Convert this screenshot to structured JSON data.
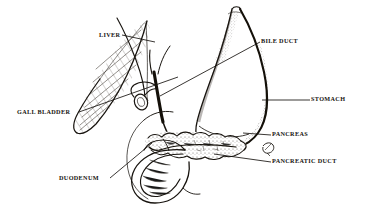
{
  "figure": {
    "kind": "anatomical-line-drawing",
    "background_color": "#ffffff",
    "ink_color": "#16130f",
    "width": 367,
    "height": 219
  },
  "labels": {
    "liver": "LIVER",
    "bile_duct": "BILE DUCT",
    "gall_bladder": "GALL BLADDER",
    "stomach": "STOMACH",
    "pancreas": "PANCREAS",
    "pancreatic_duct": "PANCREATIC DUCT",
    "duodenum": "DUODENUM"
  },
  "structures": [
    {
      "name": "liver",
      "description": "large hatched wedge / teardrop at upper left, apex pointing down-left"
    },
    {
      "name": "gall-bladder",
      "description": "small oval sac tucked under the lower right edge of the liver"
    },
    {
      "name": "bile-duct",
      "description": "thick dark duct descending from the liver hilum to the duodenum"
    },
    {
      "name": "stomach",
      "description": "large J-shaped organ at right with heavily shaded greater curvature"
    },
    {
      "name": "pancreas",
      "description": "lobulated elongated gland lying horizontally beneath the stomach"
    },
    {
      "name": "pancreatic-duct",
      "description": "fine duct running the length of the pancreas into the duodenum"
    },
    {
      "name": "duodenum",
      "description": "C-shaped loop of small intestine cradling the head of the pancreas"
    }
  ]
}
